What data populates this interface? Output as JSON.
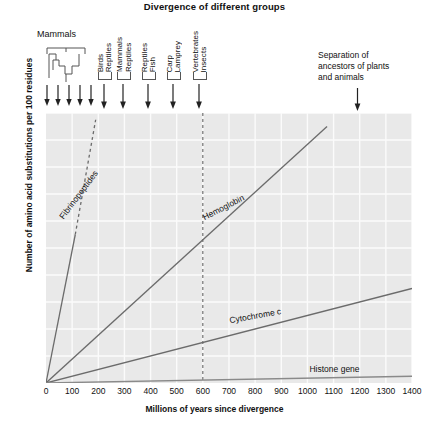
{
  "chart_title": "Divergence of different groups",
  "axes": {
    "xlabel": "Millions of years since divergence",
    "ylabel": "Number of amino acid substitutions per 100 residues",
    "xticks": [
      0,
      100,
      200,
      300,
      400,
      500,
      600,
      700,
      800,
      900,
      1000,
      1100,
      1200,
      1300,
      1400
    ],
    "yticks": [
      20,
      40,
      60,
      80,
      100,
      120,
      140,
      160,
      180,
      200
    ],
    "xlim": [
      0,
      1400
    ],
    "ylim": [
      0,
      200
    ]
  },
  "annotations": {
    "mammals_label": "Mammals",
    "separation_note_line1": "Separation of",
    "separation_note_line2": "ancestors of plants",
    "separation_note_line3": "and animals",
    "separation_year": 1190,
    "mammals_arrow_count": 5,
    "groups": [
      {
        "labels": [
          "Birds",
          "Reptiles"
        ],
        "year": 225
      },
      {
        "labels": [
          "Mammals",
          "Reptiles"
        ],
        "year": 300
      },
      {
        "labels": [
          "Reptiles",
          "Fish"
        ],
        "year": 395
      },
      {
        "labels": [
          "Carp",
          "Lamprey"
        ],
        "year": 490
      },
      {
        "labels": [
          "Vertebrates",
          "Insects"
        ],
        "year": 590
      }
    ],
    "divider_year": 600
  },
  "chart_data": {
    "type": "line",
    "title": "Divergence of different groups",
    "xlabel": "Millions of years since divergence",
    "ylabel": "Number of amino acid substitutions per 100 residues",
    "xlim": [
      0,
      1400
    ],
    "ylim": [
      0,
      200
    ],
    "grid": true,
    "legend_position": "inline-labels",
    "series": [
      {
        "name": "Fibrinopeptides",
        "label": "Fibrinopeptides",
        "color": "#6b6b6b",
        "style": "solid-then-dashed",
        "solid_points": [
          [
            0,
            0
          ],
          [
            112,
            110
          ]
        ],
        "dashed_points": [
          [
            112,
            110
          ],
          [
            190,
            195
          ]
        ],
        "label_angle_deg": -53,
        "rate_per_100my": 103
      },
      {
        "name": "Hemoglobin",
        "label": "Hemoglobin",
        "color": "#6b6b6b",
        "style": "solid",
        "points": [
          [
            0,
            0
          ],
          [
            1075,
            190
          ]
        ],
        "label_angle_deg": -27,
        "rate_per_100my": 17.7
      },
      {
        "name": "Cytochrome c",
        "label": "Cytochrome c",
        "color": "#6b6b6b",
        "style": "solid",
        "points": [
          [
            0,
            0
          ],
          [
            1400,
            70
          ]
        ],
        "label_angle_deg": -10,
        "rate_per_100my": 5.0
      },
      {
        "name": "Histone gene",
        "label": "Histone gene",
        "color": "#8a8a8a",
        "style": "solid",
        "points": [
          [
            0,
            0
          ],
          [
            1400,
            5
          ]
        ],
        "label_angle_deg": 0,
        "rate_per_100my": 0.36
      }
    ],
    "vertical_marker": {
      "x": 600,
      "style": "dashed"
    }
  }
}
